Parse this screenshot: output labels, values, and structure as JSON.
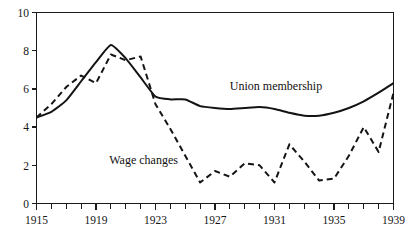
{
  "chart_data": {
    "type": "line",
    "title": "",
    "xlabel": "",
    "ylabel": "",
    "xlim": [
      1915,
      1939
    ],
    "ylim": [
      0,
      10
    ],
    "grid": false,
    "legend_position": "inline-annotation",
    "x_tick_interval": 1,
    "x_label_interval": 4,
    "y_tick_interval": 2,
    "x_tick_labels": [
      "1915",
      "1919",
      "1923",
      "1927",
      "1931",
      "1935",
      "1939"
    ],
    "x_tick_values": [
      1915,
      1919,
      1923,
      1927,
      1931,
      1935,
      1939
    ],
    "y_tick_labels": [
      "0",
      "2",
      "4",
      "6",
      "8",
      "10"
    ],
    "y_tick_values": [
      0,
      2,
      4,
      6,
      8,
      10
    ],
    "x": [
      1915,
      1916,
      1917,
      1918,
      1919,
      1920,
      1921,
      1922,
      1923,
      1924,
      1925,
      1926,
      1927,
      1928,
      1929,
      1930,
      1931,
      1932,
      1933,
      1934,
      1935,
      1936,
      1937,
      1938,
      1939
    ],
    "series": [
      {
        "name": "Union membership",
        "style": "solid",
        "color": "#141414",
        "annotation": "Union membership",
        "annotation_x": 1931.1,
        "annotation_y": 5.95,
        "values": [
          4.5,
          4.8,
          5.4,
          6.4,
          7.4,
          8.3,
          7.6,
          6.6,
          5.6,
          5.45,
          5.45,
          5.1,
          5.0,
          4.95,
          5.0,
          5.05,
          4.95,
          4.75,
          4.6,
          4.6,
          4.75,
          5.0,
          5.35,
          5.8,
          6.3
        ]
      },
      {
        "name": "Wage changes",
        "style": "dashed",
        "color": "#141414",
        "annotation": "Wage changes",
        "annotation_x": 1922.2,
        "annotation_y": 2.05,
        "values": [
          4.5,
          5.2,
          6.1,
          6.7,
          6.3,
          7.8,
          7.5,
          7.7,
          5.2,
          3.9,
          2.5,
          1.1,
          1.7,
          1.4,
          2.1,
          2.0,
          1.1,
          3.1,
          2.2,
          1.2,
          1.3,
          2.5,
          4.0,
          2.7,
          5.8
        ]
      }
    ]
  },
  "annotations": {
    "union_membership": "Union membership",
    "wage_changes": "Wage changes"
  }
}
